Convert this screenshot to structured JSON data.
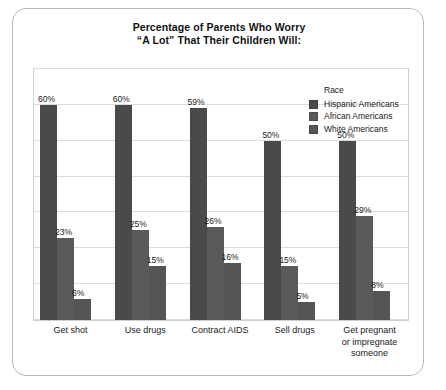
{
  "title": {
    "line1": "Percentage of Parents Who Worry",
    "line2": "“A Lot” That Their Children Will:"
  },
  "legend": {
    "heading": "Race",
    "items": [
      {
        "label": "Hispanic Americans",
        "color": "#4a4a4a"
      },
      {
        "label": "African Americans",
        "color": "#5a5a5a"
      },
      {
        "label": "White Americans",
        "color": "#555555"
      }
    ]
  },
  "chart_data": {
    "type": "bar",
    "title": "Percentage of Parents Who Worry “A Lot” That Their Children Will:",
    "xlabel": "",
    "ylabel": "",
    "ylim": [
      0,
      70
    ],
    "grid": true,
    "gridlines": [
      0,
      10,
      20,
      30,
      40,
      50,
      60,
      70
    ],
    "legend_position": "top-right",
    "legend_title": "Race",
    "value_suffix": "%",
    "categories": [
      "Get shot",
      "Use drugs",
      "Contract AIDS",
      "Sell drugs",
      "Get pregnant or impregnate someone"
    ],
    "category_lines": [
      [
        "Get shot"
      ],
      [
        "Use drugs"
      ],
      [
        "Contract AIDS"
      ],
      [
        "Sell drugs"
      ],
      [
        "Get pregnant",
        "or impregnate",
        "someone"
      ]
    ],
    "series": [
      {
        "name": "Hispanic Americans",
        "color": "#4a4a4a",
        "values": [
          60,
          60,
          59,
          50,
          50
        ],
        "labels": [
          "60%",
          "60%",
          "59%",
          "50%",
          "50%"
        ]
      },
      {
        "name": "African Americans",
        "color": "#5a5a5a",
        "values": [
          23,
          25,
          26,
          15,
          29
        ],
        "labels": [
          "23%",
          "25%",
          "26%",
          "15%",
          "29%"
        ]
      },
      {
        "name": "White Americans",
        "color": "#555555",
        "values": [
          6,
          15,
          16,
          5,
          8
        ],
        "labels": [
          "6%",
          "15%",
          "16%",
          "5%",
          "8%"
        ]
      }
    ]
  }
}
